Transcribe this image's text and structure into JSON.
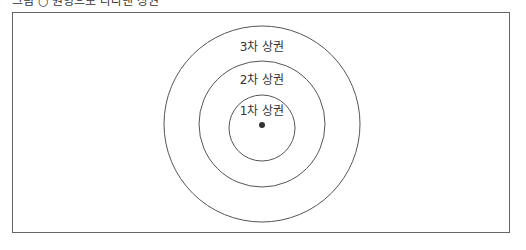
{
  "caption": "그림 ○ 원형으로 나타낸 상권",
  "diagram": {
    "type": "concentric-circles",
    "center": {
      "x": 262,
      "y": 124
    },
    "rings": [
      {
        "label": "3차 상권",
        "radius": 98
      },
      {
        "label": "2차 상권",
        "radius": 63
      },
      {
        "label": "1차 상권",
        "radius": 33
      }
    ],
    "center_point": true,
    "stroke_color": "#555555"
  }
}
